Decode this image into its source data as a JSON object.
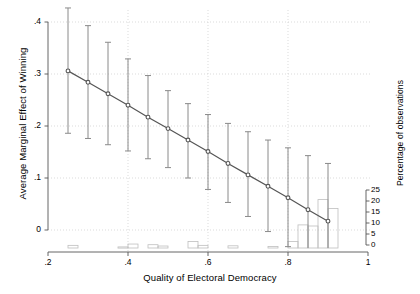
{
  "chart_data": {
    "type": "line",
    "title": "",
    "subtitle": "",
    "xlabel": "Quality of Electoral Democracy",
    "ylabel": "Average Marginal Effect of Winning",
    "ylabel_right": "Percentage of observations",
    "xlim": [
      0.2,
      1.0
    ],
    "ylim": [
      -0.035,
      0.42
    ],
    "ylim_right": [
      0,
      27.5
    ],
    "grid": true,
    "legend": "none",
    "xticks": [
      0.2,
      0.4,
      0.6,
      0.8,
      1.0
    ],
    "xtick_labels": [
      ".2",
      ".4",
      ".6",
      ".8",
      "1"
    ],
    "yticks": [
      0,
      0.1,
      0.2,
      0.3,
      0.4
    ],
    "ytick_labels": [
      "0",
      ".1",
      ".2",
      ".3",
      ".4"
    ],
    "right_yticks": [
      0,
      5,
      10,
      15,
      20,
      25
    ],
    "right_ytick_labels": [
      "0",
      "5",
      "10",
      "15",
      "20",
      "25"
    ],
    "series": [
      {
        "name": "Average Marginal Effect of Winning",
        "type": "line-with-ci",
        "marker": "circle",
        "color": "#555555",
        "x": [
          0.25,
          0.3,
          0.35,
          0.4,
          0.45,
          0.5,
          0.55,
          0.6,
          0.65,
          0.7,
          0.75,
          0.8,
          0.85,
          0.9
        ],
        "y": [
          0.306,
          0.284,
          0.262,
          0.24,
          0.217,
          0.195,
          0.173,
          0.151,
          0.128,
          0.106,
          0.084,
          0.062,
          0.039,
          0.017
        ],
        "ci_low": [
          0.186,
          0.176,
          0.164,
          0.152,
          0.137,
          0.12,
          0.1,
          0.078,
          0.053,
          0.026,
          -0.003,
          -0.032,
          -0.062,
          -0.092
        ],
        "ci_high": [
          0.427,
          0.393,
          0.361,
          0.329,
          0.297,
          0.268,
          0.243,
          0.222,
          0.205,
          0.189,
          0.173,
          0.158,
          0.143,
          0.128
        ]
      },
      {
        "name": "Percentage of observations",
        "type": "histogram",
        "color": "#bfbfbf",
        "axis": "right",
        "bin_width": 0.025,
        "bins_left": [
          0.25,
          0.375,
          0.4,
          0.45,
          0.475,
          0.55,
          0.575,
          0.65,
          0.75,
          0.8,
          0.825,
          0.85,
          0.875,
          0.9
        ],
        "values": [
          1.2,
          0.5,
          1.8,
          1.5,
          0.9,
          3.0,
          1.2,
          1.0,
          0.7,
          3.0,
          10.5,
          10.0,
          22.0,
          18.0
        ]
      }
    ]
  },
  "axes": {
    "left_title": "Average Marginal Effect of Winning",
    "right_title": "Percentage of observations",
    "bottom_title": "Quality of Electoral Democracy"
  }
}
